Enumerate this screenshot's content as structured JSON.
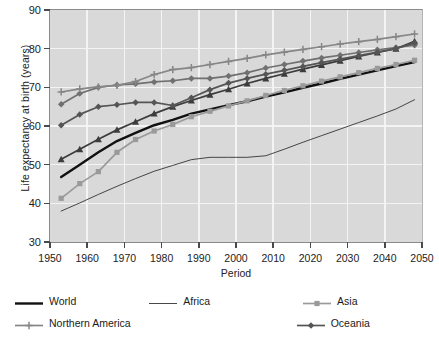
{
  "chart_data": {
    "type": "line",
    "title": "",
    "xlabel": "Period",
    "ylabel": "Life expectancy at birth (years)",
    "xlim": [
      1950,
      2050
    ],
    "ylim": [
      30,
      90
    ],
    "xticks": [
      1950,
      1960,
      1970,
      1980,
      1990,
      2000,
      2010,
      2020,
      2030,
      2040,
      2050
    ],
    "yticks": [
      30,
      40,
      50,
      60,
      70,
      80,
      90
    ],
    "grid": true,
    "legend_position": "below",
    "x": [
      1953,
      1958,
      1963,
      1968,
      1973,
      1978,
      1983,
      1988,
      1993,
      1998,
      2003,
      2008,
      2013,
      2018,
      2023,
      2028,
      2033,
      2038,
      2043,
      2048
    ],
    "series": [
      {
        "name": "World",
        "marker": "none",
        "color": "#111111",
        "width": 2.4,
        "values": [
          46.8,
          50.0,
          53.2,
          56.1,
          58.2,
          60.2,
          61.6,
          63.2,
          64.3,
          65.4,
          66.4,
          67.6,
          68.7,
          69.9,
          71.0,
          72.2,
          73.3,
          74.4,
          75.5,
          76.5
        ]
      },
      {
        "name": "Africa",
        "marker": "none",
        "color": "#333333",
        "width": 0.9,
        "values": [
          38.0,
          40.1,
          42.3,
          44.4,
          46.4,
          48.3,
          49.8,
          51.3,
          51.9,
          51.9,
          51.9,
          52.3,
          54.0,
          55.8,
          57.5,
          59.2,
          60.9,
          62.6,
          64.4,
          66.8
        ]
      },
      {
        "name": "Asia",
        "marker": "square",
        "color": "#9a9a9a",
        "width": 1.7,
        "values": [
          41.3,
          45.1,
          48.2,
          53.2,
          56.5,
          58.7,
          60.4,
          62.4,
          63.8,
          65.2,
          66.5,
          67.9,
          69.2,
          70.4,
          71.6,
          72.7,
          73.8,
          74.9,
          75.9,
          77.0
        ]
      },
      {
        "name": "Europe",
        "marker": "diamond",
        "color": "#707070",
        "width": 1.7,
        "values": [
          65.6,
          68.4,
          70.0,
          70.6,
          70.9,
          71.4,
          71.7,
          72.3,
          72.3,
          72.9,
          73.8,
          75.0,
          75.9,
          76.8,
          77.6,
          78.3,
          79.0,
          79.7,
          80.3,
          80.9
        ]
      },
      {
        "name": "Latin America and the Caribbean",
        "marker": "triangle",
        "color": "#3c3c3c",
        "width": 1.7,
        "values": [
          51.4,
          54.0,
          56.6,
          59.0,
          61.1,
          63.2,
          65.0,
          66.6,
          68.1,
          69.5,
          71.0,
          72.3,
          73.5,
          74.7,
          75.8,
          76.9,
          78.0,
          79.0,
          80.0,
          81.9
        ]
      },
      {
        "name": "Northern America",
        "marker": "plus",
        "color": "#868686",
        "width": 1.7,
        "values": [
          68.8,
          69.6,
          70.1,
          70.5,
          71.5,
          73.3,
          74.6,
          75.1,
          75.9,
          76.7,
          77.5,
          78.4,
          79.1,
          79.8,
          80.5,
          81.2,
          81.8,
          82.4,
          83.1,
          83.8
        ]
      },
      {
        "name": "Oceania",
        "marker": "diamond",
        "color": "#555555",
        "width": 1.7,
        "values": [
          60.2,
          63.0,
          65.0,
          65.5,
          66.1,
          66.1,
          65.3,
          67.3,
          69.4,
          71.1,
          72.3,
          73.4,
          74.4,
          75.4,
          76.4,
          77.3,
          78.2,
          79.1,
          80.0,
          81.5
        ]
      }
    ]
  },
  "legend": {
    "rows": [
      [
        {
          "label": "World",
          "label2": "",
          "series": 0
        },
        {
          "label": "Africa",
          "label2": "",
          "series": 1
        },
        {
          "label": "Asia",
          "label2": "",
          "series": 2
        },
        {
          "label": "Europe",
          "label2": "",
          "series": 3
        },
        {
          "label": "Latin America",
          "label2": "and the Caribbean",
          "series": 4
        }
      ],
      [
        {
          "label": "Northern America",
          "label2": "",
          "series": 5
        },
        {
          "label": "Oceania",
          "label2": "",
          "series": 6
        }
      ]
    ]
  }
}
